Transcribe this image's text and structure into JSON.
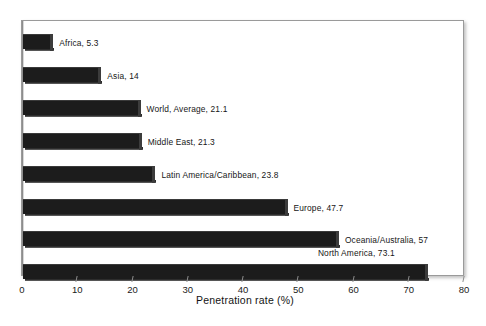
{
  "chart_data": {
    "type": "bar",
    "orientation": "horizontal",
    "title": "",
    "xlabel": "Penetration rate (%)",
    "ylabel": "",
    "xlim": [
      0,
      80
    ],
    "xticks": [
      0,
      10,
      20,
      30,
      40,
      50,
      60,
      70,
      80
    ],
    "grid": false,
    "legend": false,
    "categories": [
      "Africa",
      "Asia",
      "World, Average",
      "Middle East",
      "Latin America/Caribbean",
      "Europe",
      "Oceania/Australia",
      "North America"
    ],
    "values": [
      5.3,
      14,
      21.1,
      21.3,
      23.8,
      47.7,
      57,
      73.1
    ],
    "point_labels": [
      "Africa, 5.3",
      "Asia, 14",
      "World, Average, 21.1",
      "Middle East, 21.3",
      "Latin America/Caribbean, 23.8",
      "Europe, 47.7",
      "Oceania/Australia, 57",
      "North America, 73.1"
    ],
    "bar_color": "#1c1c1c",
    "background_color": "#ffffff",
    "frame_color": "#9a9a9a"
  },
  "axis": {
    "x_title": "Penetration rate (%)",
    "tick_labels": [
      "0",
      "10",
      "20",
      "30",
      "40",
      "50",
      "60",
      "70",
      "80"
    ]
  },
  "caption": {
    "cropped_line": ""
  }
}
